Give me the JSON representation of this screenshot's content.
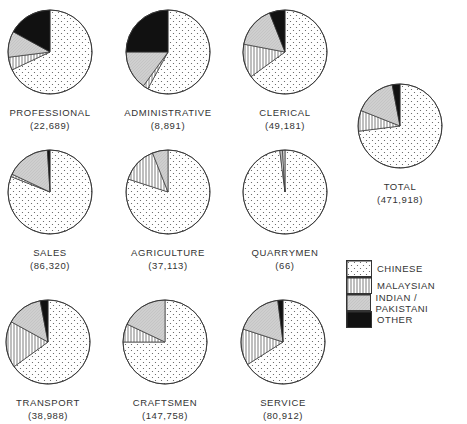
{
  "chart_data": {
    "type": "pie",
    "title": "",
    "legend_position": "right",
    "categories": [
      "Chinese",
      "Malaysian",
      "Indian / Pakistani",
      "Other"
    ],
    "legend": [
      {
        "label": "CHINESE",
        "pattern": "dots"
      },
      {
        "label": "MALAYSIAN",
        "pattern": "vertical-lines"
      },
      {
        "label": "INDIAN / PAKISTANI",
        "pattern": "grey"
      },
      {
        "label": "OTHER",
        "pattern": "black"
      }
    ],
    "pies": [
      {
        "name": "PROFESSIONAL",
        "total": "(22,689)",
        "values": [
          68,
          5,
          10,
          17
        ]
      },
      {
        "name": "ADMINISTRATIVE",
        "total": "(8,891)",
        "values": [
          58,
          2,
          15,
          25
        ]
      },
      {
        "name": "CLERICAL",
        "total": "(49,181)",
        "values": [
          65,
          13,
          16,
          6
        ]
      },
      {
        "name": "TOTAL",
        "total": "(471,918)",
        "values": [
          73,
          8,
          16,
          3
        ]
      },
      {
        "name": "SALES",
        "total": "(86,320)",
        "values": [
          81,
          1,
          17,
          1
        ]
      },
      {
        "name": "AGRICULTURE",
        "total": "(37,113)",
        "values": [
          80,
          14,
          6,
          0
        ]
      },
      {
        "name": "QUARRYMEN",
        "total": "(66)",
        "values": [
          98,
          1,
          1,
          0
        ]
      },
      {
        "name": "TRANSPORT",
        "total": "(38,988)",
        "values": [
          65,
          18,
          14,
          3
        ]
      },
      {
        "name": "CRAFTSMEN",
        "total": "(147,758)",
        "values": [
          75,
          7,
          18,
          0
        ]
      },
      {
        "name": "SERVICE",
        "total": "(80,912)",
        "values": [
          66,
          14,
          18,
          2
        ]
      }
    ],
    "units": "percent of workforce (estimated from slice angles)"
  },
  "layout": {
    "positions": [
      {
        "left": -10,
        "top": 8
      },
      {
        "left": 108,
        "top": 8
      },
      {
        "left": 225,
        "top": 8
      },
      {
        "left": 340,
        "top": 82
      },
      {
        "left": -10,
        "top": 148
      },
      {
        "left": 108,
        "top": 148
      },
      {
        "left": 225,
        "top": 148
      },
      {
        "left": -12,
        "top": 298
      },
      {
        "left": 105,
        "top": 298
      },
      {
        "left": 223,
        "top": 298
      }
    ]
  }
}
